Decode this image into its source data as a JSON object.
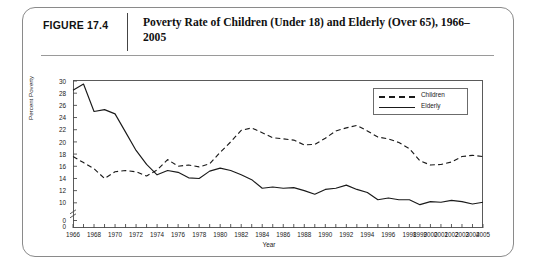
{
  "figure": {
    "number_label": "FIGURE 17.4",
    "title": "Poverty Rate of Children (Under 18) and Elderly (Over 65), 1966–2005"
  },
  "legend": {
    "position": "top-right",
    "entries": [
      {
        "label": "Children",
        "style": "dashed"
      },
      {
        "label": "Elderly",
        "style": "solid"
      }
    ]
  },
  "axes": {
    "ylabel": "Percent Poverty",
    "xlabel": "Year",
    "yticks": [
      "0",
      "0",
      "10",
      "12",
      "14",
      "16",
      "18",
      "20",
      "22",
      "24",
      "26",
      "28",
      "30"
    ],
    "y_axis_break": true,
    "xtick_labels": [
      "1966",
      "1968",
      "1970",
      "1972",
      "1974",
      "1976",
      "1978",
      "1980",
      "1982",
      "1984",
      "1986",
      "1988",
      "1990",
      "1992",
      "1994",
      "1996",
      "1998",
      "1999",
      "2000",
      "2001",
      "2002",
      "2003",
      "2004",
      "2005"
    ]
  },
  "chart_data": {
    "type": "line",
    "title": "Poverty Rate of Children (Under 18) and Elderly (Over 65), 1966–2005",
    "xlabel": "Year",
    "ylabel": "Percent Poverty",
    "ylim": [
      8,
      30
    ],
    "grid": false,
    "legend_position": "top-right",
    "x": [
      1966,
      1967,
      1968,
      1969,
      1970,
      1971,
      1972,
      1973,
      1974,
      1975,
      1976,
      1977,
      1978,
      1979,
      1980,
      1981,
      1982,
      1983,
      1984,
      1985,
      1986,
      1987,
      1988,
      1989,
      1990,
      1991,
      1992,
      1993,
      1994,
      1995,
      1996,
      1997,
      1998,
      1999,
      2000,
      2001,
      2002,
      2003,
      2004,
      2005
    ],
    "series": [
      {
        "name": "Children",
        "style": "dashed",
        "values": [
          17.6,
          16.6,
          15.6,
          14.0,
          15.1,
          15.3,
          15.1,
          14.4,
          15.4,
          17.1,
          16.0,
          16.2,
          15.9,
          16.4,
          18.3,
          20.0,
          21.9,
          22.3,
          21.5,
          20.7,
          20.5,
          20.3,
          19.5,
          19.6,
          20.6,
          21.8,
          22.3,
          22.7,
          21.8,
          20.8,
          20.5,
          19.9,
          18.9,
          16.9,
          16.2,
          16.3,
          16.7,
          17.6,
          17.8,
          17.6
        ]
      },
      {
        "name": "Elderly",
        "style": "solid",
        "values": [
          28.5,
          29.5,
          25.0,
          25.3,
          24.6,
          21.6,
          18.6,
          16.3,
          14.6,
          15.3,
          15.0,
          14.1,
          14.0,
          15.2,
          15.7,
          15.3,
          14.6,
          13.8,
          12.4,
          12.6,
          12.4,
          12.5,
          12.0,
          11.4,
          12.2,
          12.4,
          12.9,
          12.2,
          11.7,
          10.5,
          10.8,
          10.5,
          10.5,
          9.7,
          10.2,
          10.1,
          10.4,
          10.2,
          9.8,
          10.1
        ]
      }
    ]
  }
}
